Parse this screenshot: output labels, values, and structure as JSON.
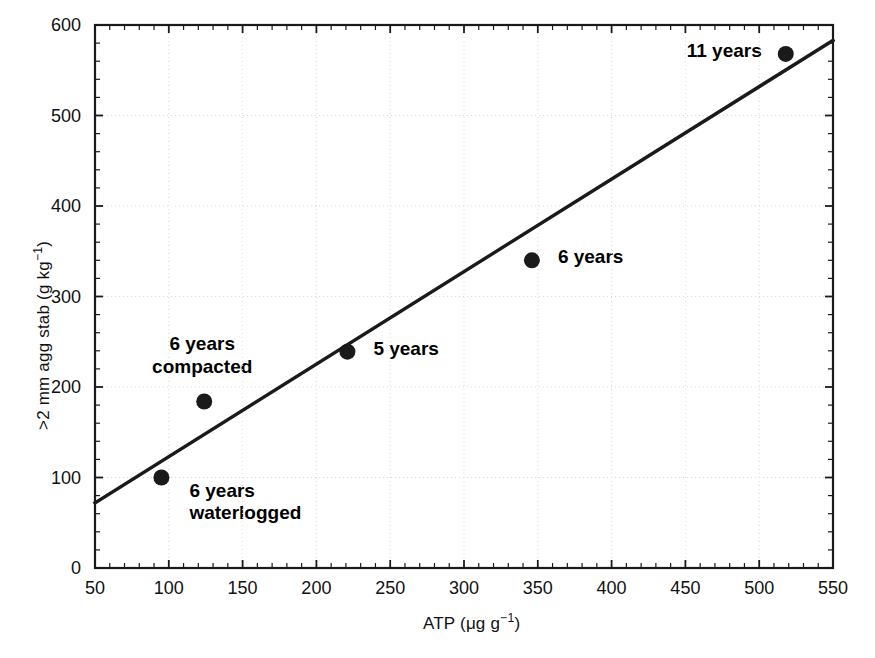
{
  "chart_data": {
    "type": "scatter",
    "title": "",
    "xlabel": "ATP (μg g⁻¹)",
    "ylabel": ">2 mm agg stab (g kg⁻¹)",
    "xlim": [
      50,
      550
    ],
    "ylim": [
      0,
      600
    ],
    "xticks": [
      50,
      100,
      150,
      200,
      250,
      300,
      350,
      400,
      450,
      500,
      550
    ],
    "yticks": [
      0,
      100,
      200,
      300,
      400,
      500,
      600
    ],
    "xtick_labels": [
      "50",
      "100",
      "150",
      "200",
      "250",
      "300",
      "350",
      "400",
      "450",
      "500",
      "550"
    ],
    "ytick_labels": [
      "0",
      "100",
      "200",
      "300",
      "400",
      "500",
      "600"
    ],
    "grid": true,
    "legend": "none",
    "minor_ticks": true,
    "points": [
      {
        "x": 95,
        "y": 100,
        "label": "6 years\nwaterlogged",
        "label_lines": [
          "6 years",
          "waterlogged"
        ],
        "label_position": "right"
      },
      {
        "x": 124,
        "y": 184,
        "label": "6 years\ncompacted",
        "label_lines": [
          "6 years",
          "compacted"
        ],
        "label_position": "above"
      },
      {
        "x": 221,
        "y": 239,
        "label": "5 years",
        "label_lines": [
          "5 years"
        ],
        "label_position": "right"
      },
      {
        "x": 346,
        "y": 340,
        "label": "6 years",
        "label_lines": [
          "6 years"
        ],
        "label_position": "right"
      },
      {
        "x": 518,
        "y": 568,
        "label": "11 years",
        "label_lines": [
          "11 years"
        ],
        "label_position": "left"
      }
    ],
    "trendline": {
      "type": "linear",
      "x_start": 50,
      "y_start": 72,
      "x_end": 550,
      "y_end": 583
    },
    "marker": {
      "shape": "circle",
      "color": "#1a1a1a",
      "size": 15
    },
    "line_color": "#1a1a1a",
    "grid_color": "#d9d9d9",
    "axis_color": "#1a1a1a",
    "background": "#ffffff"
  },
  "annotations": {
    "waterlogged_line1": "6 years",
    "waterlogged_line2": "waterlogged",
    "compacted_line1": "6 years",
    "compacted_line2": "compacted",
    "five_years": "5 years",
    "six_years": "6 years",
    "eleven_years": "11 years"
  },
  "axes": {
    "x_title": "ATP (μg g⁻¹)",
    "y_title": ">2 mm agg stab (g kg⁻¹)",
    "x_title_base": "ATP (μg g",
    "x_title_sup": "−1",
    "x_title_tail": ")",
    "y_title_base": ">2 mm agg stab (g kg",
    "y_title_sup": "−1",
    "y_title_tail": ")"
  }
}
